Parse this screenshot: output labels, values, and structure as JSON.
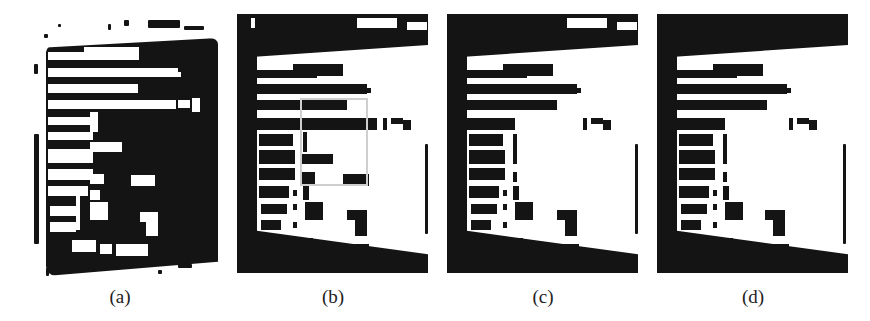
{
  "figure": {
    "panels": [
      {
        "id": "a",
        "caption": "(a)",
        "style": "white text on dark plate, noisy background",
        "plate_color": "#141414",
        "text_color": "#ffffff",
        "roi_box": false
      },
      {
        "id": "b",
        "caption": "(b)",
        "style": "inverted, dark text on white plate with dark surround",
        "plate_color": "#ffffff",
        "text_color": "#141414",
        "roi_box": true,
        "roi_color": "#cfcfcf"
      },
      {
        "id": "c",
        "caption": "(c)",
        "style": "inverted, region inside ROI cleaned",
        "plate_color": "#ffffff",
        "text_color": "#141414",
        "roi_box": false
      },
      {
        "id": "d",
        "caption": "(d)",
        "style": "inverted, final cleaned result",
        "plate_color": "#ffffff",
        "text_color": "#141414",
        "roi_box": false
      }
    ]
  }
}
